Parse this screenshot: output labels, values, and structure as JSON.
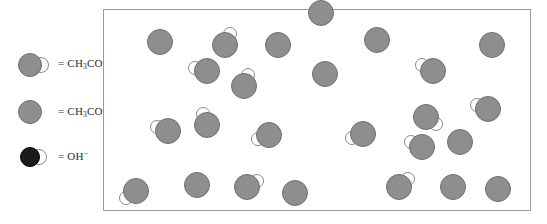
{
  "diagram": {
    "legend": {
      "items": [
        {
          "id": "acetic-acid",
          "species": "acid",
          "equals": "=",
          "formula_html": "CH3CO2H",
          "formula_parts": {
            "pre": "CH",
            "sub1": "3",
            "mid": "CO",
            "sub2": "2",
            "post": "H",
            "charge": ""
          },
          "label": "= CH3CO2H"
        },
        {
          "id": "acetate-ion",
          "species": "anion",
          "equals": "=",
          "formula_html": "CH3CO2-",
          "formula_parts": {
            "pre": "CH",
            "sub1": "3",
            "mid": "CO",
            "sub2": "2",
            "post": "",
            "charge": "−"
          },
          "label": "= CH3CO2−"
        },
        {
          "id": "hydroxide-ion",
          "species": "hydroxide",
          "equals": "=",
          "formula_html": "OH-",
          "formula_parts": {
            "pre": "OH",
            "sub1": "",
            "mid": "",
            "sub2": "",
            "post": "",
            "charge": "−"
          },
          "label": "= OH−"
        }
      ]
    },
    "panel": {
      "x": 103,
      "y": 9,
      "width": 428,
      "height": 202,
      "border_color": "#9a9a9a",
      "background_color": "#ffffff"
    },
    "colors": {
      "particle_gray": "#8e8e8e",
      "particle_outline": "#6f6f6f",
      "hydroxide_dark": "#1b1b1b",
      "lobe_white": "#ffffff",
      "lobe_outline": "#8a8a8a",
      "text": "#2b2b2b"
    },
    "counts": {
      "acetic_acid": 13,
      "acetate_ion": 12,
      "hydroxide_ion": 0,
      "total": 25
    },
    "particles": [
      {
        "species": "acid",
        "cx": 159,
        "cy": 41,
        "r": 13,
        "lobe": false,
        "lobe_angle": 0,
        "lobe_r": 0
      },
      {
        "species": "acid",
        "cx": 224,
        "cy": 44,
        "r": 13,
        "lobe": true,
        "lobe_angle": 295,
        "lobe_r": 7
      },
      {
        "species": "anion",
        "cx": 277,
        "cy": 44,
        "r": 13,
        "lobe": false,
        "lobe_angle": 0,
        "lobe_r": 0
      },
      {
        "species": "anion",
        "cx": 376,
        "cy": 39,
        "r": 13,
        "lobe": false,
        "lobe_angle": 0,
        "lobe_r": 0
      },
      {
        "species": "anion",
        "cx": 491,
        "cy": 44,
        "r": 13,
        "lobe": false,
        "lobe_angle": 0,
        "lobe_r": 0
      },
      {
        "species": "acid",
        "cx": 206,
        "cy": 70,
        "r": 13,
        "lobe": true,
        "lobe_angle": 195,
        "lobe_r": 7
      },
      {
        "species": "anion",
        "cx": 324,
        "cy": 73,
        "r": 13,
        "lobe": false,
        "lobe_angle": 0,
        "lobe_r": 0
      },
      {
        "species": "acid",
        "cx": 432,
        "cy": 70,
        "r": 13,
        "lobe": true,
        "lobe_angle": 208,
        "lobe_r": 7
      },
      {
        "species": "acid",
        "cx": 320,
        "cy": 12,
        "r": 13,
        "lobe": false,
        "lobe_angle": 0,
        "lobe_r": 0
      },
      {
        "species": "acid",
        "cx": 243,
        "cy": 85,
        "r": 13,
        "lobe": true,
        "lobe_angle": 290,
        "lobe_r": 7
      },
      {
        "species": "acid",
        "cx": 487,
        "cy": 108,
        "r": 13,
        "lobe": true,
        "lobe_angle": 200,
        "lobe_r": 7
      },
      {
        "species": "acid",
        "cx": 167,
        "cy": 130,
        "r": 13,
        "lobe": true,
        "lobe_angle": 200,
        "lobe_r": 7
      },
      {
        "species": "acid",
        "cx": 206,
        "cy": 124,
        "r": 13,
        "lobe": true,
        "lobe_angle": 250,
        "lobe_r": 7
      },
      {
        "species": "acid",
        "cx": 268,
        "cy": 134,
        "r": 13,
        "lobe": true,
        "lobe_angle": 160,
        "lobe_r": 7
      },
      {
        "species": "acid",
        "cx": 362,
        "cy": 133,
        "r": 13,
        "lobe": true,
        "lobe_angle": 160,
        "lobe_r": 7
      },
      {
        "species": "acid",
        "cx": 421,
        "cy": 146,
        "r": 13,
        "lobe": true,
        "lobe_angle": 205,
        "lobe_r": 7
      },
      {
        "species": "acid",
        "cx": 425,
        "cy": 116,
        "r": 13,
        "lobe": true,
        "lobe_angle": 35,
        "lobe_r": 7
      },
      {
        "species": "anion",
        "cx": 459,
        "cy": 141,
        "r": 13,
        "lobe": false,
        "lobe_angle": 0,
        "lobe_r": 0
      },
      {
        "species": "acid",
        "cx": 135,
        "cy": 190,
        "r": 13,
        "lobe": true,
        "lobe_angle": 145,
        "lobe_r": 7
      },
      {
        "species": "anion",
        "cx": 196,
        "cy": 184,
        "r": 13,
        "lobe": false,
        "lobe_angle": 0,
        "lobe_r": 0
      },
      {
        "species": "acid",
        "cx": 246,
        "cy": 186,
        "r": 13,
        "lobe": true,
        "lobe_angle": 330,
        "lobe_r": 7
      },
      {
        "species": "anion",
        "cx": 294,
        "cy": 192,
        "r": 13,
        "lobe": false,
        "lobe_angle": 0,
        "lobe_r": 0
      },
      {
        "species": "acid",
        "cx": 398,
        "cy": 186,
        "r": 13,
        "lobe": true,
        "lobe_angle": 320,
        "lobe_r": 7
      },
      {
        "species": "anion",
        "cx": 452,
        "cy": 186,
        "r": 13,
        "lobe": false,
        "lobe_angle": 0,
        "lobe_r": 0
      },
      {
        "species": "anion",
        "cx": 497,
        "cy": 188,
        "r": 13,
        "lobe": false,
        "lobe_angle": 0,
        "lobe_r": 0
      }
    ]
  }
}
